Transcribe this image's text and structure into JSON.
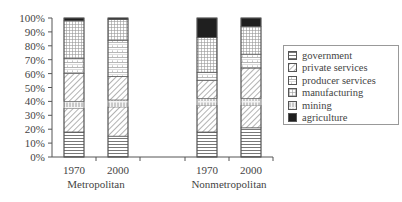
{
  "chart_data": {
    "type": "bar",
    "stacked": true,
    "title": "",
    "xlabel": "",
    "ylabel": "",
    "ylim": [
      0,
      100
    ],
    "yticks": [
      "0%",
      "10%",
      "20%",
      "30%",
      "40%",
      "50%",
      "60%",
      "70%",
      "80%",
      "90%",
      "100%"
    ],
    "groups": [
      {
        "label": "Metropolitan",
        "categories": [
          "1970",
          "2000"
        ]
      },
      {
        "label": "Nonmetropolitan",
        "categories": [
          "1970",
          "2000"
        ]
      }
    ],
    "categories": [
      "Metropolitan 1970",
      "Metropolitan 2000",
      "Nonmetropolitan 1970",
      "Nonmetropolitan 2000"
    ],
    "stack_order_bottom_to_top": [
      "government",
      "private services",
      "mining",
      "private services (upper)",
      "producer services",
      "manufacturing",
      "agriculture"
    ],
    "series": [
      {
        "name": "government",
        "pattern": "horizontal-lines",
        "values": [
          18,
          15,
          18,
          21
        ]
      },
      {
        "name": "private services",
        "pattern": "diagonal-hatch",
        "values": [
          37,
          38,
          32,
          38
        ]
      },
      {
        "name": "mining",
        "pattern": "vertical-ticks",
        "values": [
          5,
          5,
          5,
          5
        ]
      },
      {
        "name": "producer services",
        "pattern": "cross-hatch",
        "values": [
          11,
          26,
          6,
          10
        ]
      },
      {
        "name": "manufacturing",
        "pattern": "dense-grid",
        "values": [
          27,
          15,
          25,
          20
        ]
      },
      {
        "name": "agriculture",
        "pattern": "solid-black",
        "values": [
          2,
          1,
          14,
          6
        ]
      }
    ],
    "segments": [
      [
        [
          0,
          18,
          "gov"
        ],
        [
          18,
          35,
          "priv"
        ],
        [
          35,
          40,
          "min"
        ],
        [
          40,
          60,
          "priv"
        ],
        [
          60,
          71,
          "prod"
        ],
        [
          71,
          98,
          "manu"
        ],
        [
          98,
          100,
          "agri"
        ]
      ],
      [
        [
          0,
          15,
          "gov"
        ],
        [
          15,
          36,
          "priv"
        ],
        [
          36,
          41,
          "min"
        ],
        [
          41,
          58,
          "priv"
        ],
        [
          58,
          84,
          "prod"
        ],
        [
          84,
          99,
          "manu"
        ],
        [
          99,
          100,
          "agri"
        ]
      ],
      [
        [
          0,
          18,
          "gov"
        ],
        [
          18,
          37,
          "priv"
        ],
        [
          37,
          42,
          "min"
        ],
        [
          42,
          55,
          "priv"
        ],
        [
          55,
          61,
          "prod"
        ],
        [
          61,
          86,
          "manu"
        ],
        [
          86,
          100,
          "agri"
        ]
      ],
      [
        [
          0,
          21,
          "gov"
        ],
        [
          21,
          37,
          "priv"
        ],
        [
          37,
          42,
          "min"
        ],
        [
          42,
          64,
          "priv"
        ],
        [
          64,
          74,
          "prod"
        ],
        [
          74,
          94,
          "manu"
        ],
        [
          94,
          100,
          "agri"
        ]
      ]
    ],
    "legend": {
      "position": "right",
      "entries": [
        "government",
        "private services",
        "producer services",
        "manufacturing",
        "mining",
        "agriculture"
      ]
    },
    "grid": false
  },
  "legend_labels": [
    "government",
    "private services",
    "producer services",
    "manufacturing",
    "mining",
    "agriculture"
  ],
  "x_labels": {
    "m1970": "1970",
    "m2000": "2000",
    "n1970": "1970",
    "n2000": "2000"
  },
  "group_labels": {
    "metro": "Metropolitan",
    "nonmetro": "Nonmetropolitan"
  }
}
